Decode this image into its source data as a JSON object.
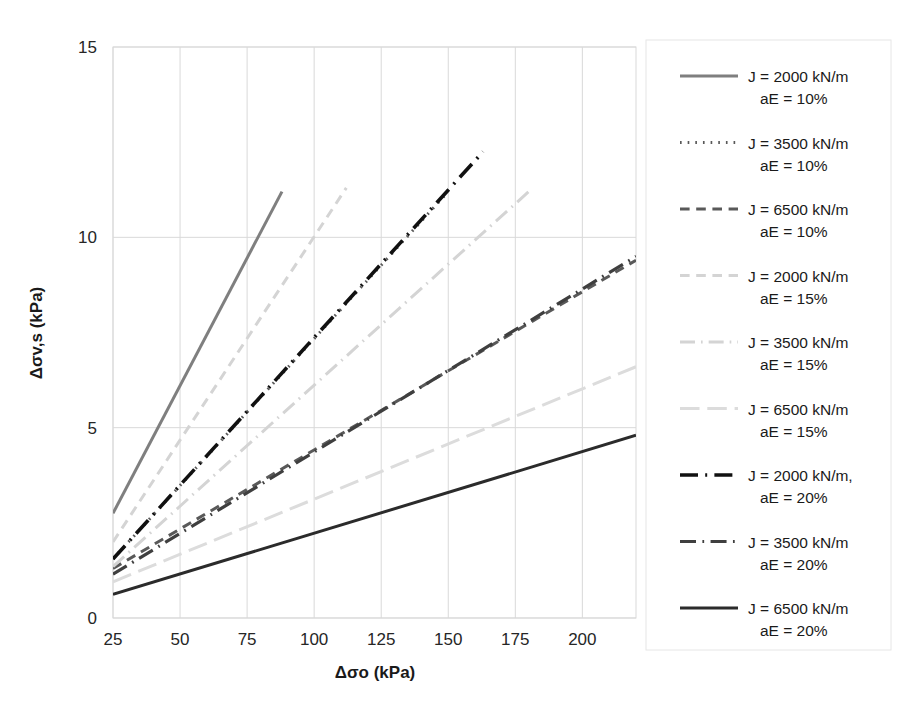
{
  "chart_data": {
    "type": "line",
    "title": "",
    "xlabel": "Δσo (kPa)",
    "ylabel": "Δσv,s (kPa)",
    "xlim": [
      25,
      220
    ],
    "ylim": [
      0,
      15
    ],
    "xticks": [
      25,
      50,
      75,
      100,
      125,
      150,
      175,
      200
    ],
    "yticks": [
      0,
      5,
      10,
      15
    ],
    "xtick_labels": [
      "25",
      "50",
      "75",
      "100",
      "125",
      "150",
      "175",
      "200"
    ],
    "ytick_labels": [
      "0",
      "5",
      "10",
      "15"
    ],
    "grid": true,
    "legend_position": "right",
    "series": [
      {
        "name": "J = 2000 kN/m aE = 10%",
        "label_line1": "J = 2000 kN/m",
        "label_line2": "aE = 10%",
        "color": "#7f7f7f",
        "style": "solid",
        "width": 3,
        "x": [
          25,
          88
        ],
        "y": [
          2.75,
          11.2
        ]
      },
      {
        "name": "J = 3500 kN/m aE = 10%",
        "label_line1": "J = 3500 kN/m",
        "label_line2": "aE = 10%",
        "color": "#595959",
        "style": "dotted",
        "width": 3,
        "x": [
          25,
          150
        ],
        "y": [
          1.55,
          11.2
        ]
      },
      {
        "name": "J = 6500 kN/m aE = 10%",
        "label_line1": "J = 6500 kN/m",
        "label_line2": "aE = 10%",
        "color": "#595959",
        "style": "dashed",
        "width": 3,
        "x": [
          25,
          220
        ],
        "y": [
          1.3,
          9.4
        ]
      },
      {
        "name": "J = 2000 kN/m aE = 15%",
        "label_line1": "J = 2000 kN/m",
        "label_line2": "aE = 15%",
        "color": "#d4d4d4",
        "style": "dashed",
        "width": 3,
        "x": [
          25,
          112
        ],
        "y": [
          2.0,
          11.3
        ]
      },
      {
        "name": "J = 3500 kN/m aE = 15%",
        "label_line1": "J = 3500 kN/m",
        "label_line2": "aE = 15%",
        "color": "#d4d4d4",
        "style": "dashdot",
        "width": 3,
        "x": [
          25,
          180
        ],
        "y": [
          1.35,
          11.2
        ]
      },
      {
        "name": "J = 6500 kN/m aE = 15%",
        "label_line1": "J = 6500 kN/m",
        "label_line2": "aE = 15%",
        "color": "#dcdcdc",
        "style": "longdash",
        "width": 3,
        "x": [
          25,
          220
        ],
        "y": [
          0.95,
          6.6
        ]
      },
      {
        "name": "J = 2000 kN/m, aE = 20%",
        "label_line1": "J = 2000 kN/m,",
        "label_line2": "aE = 20%",
        "color": "#111111",
        "style": "dashdot",
        "width": 3.6,
        "x": [
          25,
          163
        ],
        "y": [
          1.55,
          12.25
        ]
      },
      {
        "name": "J = 3500 kN/m aE = 20%",
        "label_line1": "J = 3500 kN/m",
        "label_line2": "aE = 20%",
        "color": "#3f3f3f",
        "style": "dashdot",
        "width": 3.2,
        "x": [
          25,
          220
        ],
        "y": [
          1.15,
          9.5
        ]
      },
      {
        "name": "J = 6500 kN/m aE = 20%",
        "label_line1": "J = 6500 kN/m",
        "label_line2": "aE = 20%",
        "color": "#2b2b2b",
        "style": "solid",
        "width": 3,
        "x": [
          25,
          220
        ],
        "y": [
          0.62,
          4.8
        ]
      }
    ]
  },
  "axes": {
    "x_title": "Δσo (kPa)",
    "y_title": "Δσv,s (kPa)",
    "x_ticks": [
      "25",
      "50",
      "75",
      "100",
      "125",
      "150",
      "175",
      "200"
    ],
    "y_ticks": [
      "15",
      "10",
      "5",
      "0"
    ]
  },
  "legend": {
    "entries": [
      {
        "line1": "J = 2000 kN/m",
        "line2": "aE = 10%"
      },
      {
        "line1": "J = 3500 kN/m",
        "line2": "aE = 10%"
      },
      {
        "line1": "J = 6500 kN/m",
        "line2": "aE = 10%"
      },
      {
        "line1": "J = 2000 kN/m",
        "line2": "aE = 15%"
      },
      {
        "line1": "J = 3500 kN/m",
        "line2": "aE = 15%"
      },
      {
        "line1": "J = 6500 kN/m",
        "line2": "aE = 15%"
      },
      {
        "line1": "J = 2000 kN/m,",
        "line2": "aE = 20%"
      },
      {
        "line1": "J = 3500 kN/m",
        "line2": "aE = 20%"
      },
      {
        "line1": "J = 6500 kN/m",
        "line2": "aE = 20%"
      }
    ]
  },
  "colors": {
    "grid": "#d9d9d9",
    "text": "#1a1a1a",
    "background": "#ffffff"
  }
}
